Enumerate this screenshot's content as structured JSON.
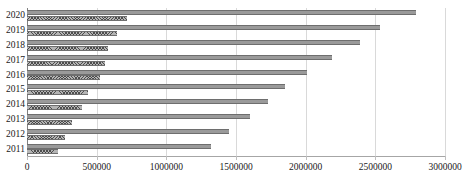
{
  "chart_data": {
    "type": "bar",
    "orientation": "horizontal",
    "title": "",
    "subtitle": "",
    "xlabel": "",
    "ylabel": "",
    "xlim": [
      0,
      3000000
    ],
    "grid": true,
    "legend_position": "none",
    "xticks": [
      0,
      500000,
      1000000,
      1500000,
      2000000,
      2500000,
      3000000
    ],
    "xtick_labels": [
      "0",
      "500000",
      "1000000",
      "1500000",
      "2000000",
      "2500000",
      "3000000"
    ],
    "categories": [
      "2020",
      "2019",
      "2018",
      "2017",
      "2016",
      "2015",
      "2014",
      "2013",
      "2012",
      "2011"
    ],
    "series": [
      {
        "name": "series-1",
        "style": "solid-gray",
        "color": "#9a9a9a",
        "values": [
          2790000,
          2530000,
          2390000,
          2190000,
          2010000,
          1850000,
          1730000,
          1600000,
          1450000,
          1320000
        ]
      },
      {
        "name": "series-2",
        "style": "cross-hatched",
        "color": "#b4b4b4",
        "values": [
          720000,
          645000,
          580000,
          560000,
          525000,
          440000,
          395000,
          325000,
          275000,
          220000
        ]
      }
    ]
  }
}
